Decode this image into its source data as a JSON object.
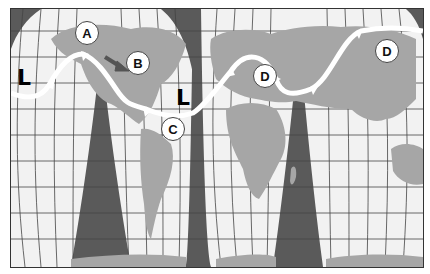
{
  "map": {
    "projection": "interrupted world map with graticule",
    "colors": {
      "ocean": "#f2f2f2",
      "land": "#a6a6a6",
      "gaps": "#5a5a5a",
      "grid": "#444444",
      "jet_stream": "#ffffff",
      "arrow": "#555555"
    },
    "markers": [
      {
        "id": "A",
        "label": "A"
      },
      {
        "id": "B",
        "label": "B"
      },
      {
        "id": "C",
        "label": "C"
      },
      {
        "id": "D1",
        "label": "D"
      },
      {
        "id": "D2",
        "label": "D"
      }
    ],
    "pressure_symbols": [
      {
        "id": "L1",
        "label": "L"
      },
      {
        "id": "L2",
        "label": "L"
      }
    ]
  }
}
